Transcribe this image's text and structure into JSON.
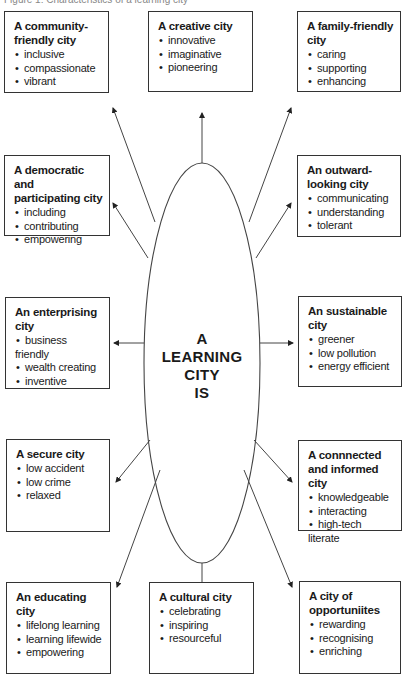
{
  "caption": "Figure 1: Characteristics of a learning city",
  "center": {
    "lines": [
      "A",
      "LEARNING",
      "CITY",
      "IS"
    ]
  },
  "boxes": [
    {
      "id": "community",
      "title": "A community-friendly city",
      "items": [
        "inclusive",
        "compassionate",
        "vibrant"
      ]
    },
    {
      "id": "creative",
      "title": "A creative city",
      "items": [
        "innovative",
        "imaginative",
        "pioneering"
      ]
    },
    {
      "id": "family",
      "title": "A family-friendly city",
      "items": [
        "caring",
        "supporting",
        "enhancing"
      ]
    },
    {
      "id": "democratic",
      "title": "A democratic and participating city",
      "items": [
        "including",
        "contributing",
        "empowering"
      ]
    },
    {
      "id": "outward",
      "title": "An outward-looking city",
      "items": [
        "communicating",
        "understanding",
        "tolerant"
      ]
    },
    {
      "id": "enterprising",
      "title": "An enterprising city",
      "items": [
        "business friendly",
        "wealth creating",
        "inventive"
      ]
    },
    {
      "id": "sustainable",
      "title": "An sustainable city",
      "items": [
        "greener",
        "low pollution",
        "energy efficient"
      ]
    },
    {
      "id": "secure",
      "title": "A secure city",
      "items": [
        "low accident",
        "low crime",
        "relaxed"
      ]
    },
    {
      "id": "connected",
      "title": "A connnected and informed city",
      "items": [
        "knowledgeable",
        "interacting",
        "high-tech literate"
      ]
    },
    {
      "id": "educating",
      "title": "An educating city",
      "items": [
        "lifelong learning",
        "learning lifewide",
        "empowering"
      ]
    },
    {
      "id": "cultural",
      "title": "A cultural city",
      "items": [
        "celebrating",
        "inspiring",
        "resourceful"
      ]
    },
    {
      "id": "opportunities",
      "title": "A city of opportuniites",
      "items": [
        "rewarding",
        "recognising",
        "enriching"
      ]
    }
  ]
}
